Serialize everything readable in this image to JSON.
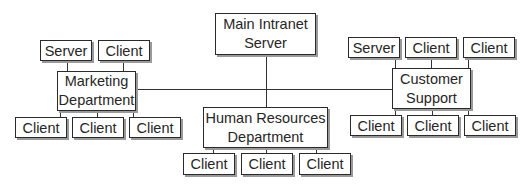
{
  "diagram": {
    "type": "network-topology",
    "main_server": {
      "label_line1": "Main Intranet",
      "label_line2": "Server"
    },
    "departments": [
      {
        "name_line1": "Marketing",
        "name_line2": "Department",
        "top_nodes": [
          "Server",
          "Client"
        ],
        "bottom_nodes": [
          "Client",
          "Client",
          "Client"
        ]
      },
      {
        "name_line1": "Human Resources",
        "name_line2": "Department",
        "top_nodes": [],
        "bottom_nodes": [
          "Client",
          "Client",
          "Client"
        ]
      },
      {
        "name_line1": "Customer",
        "name_line2": "Support",
        "top_nodes": [
          "Server",
          "Client",
          "Client"
        ],
        "bottom_nodes": [
          "Client",
          "Client",
          "Client"
        ]
      }
    ],
    "colors": {
      "line": "#333333",
      "border": "#2a2a2a",
      "shadow": "#9a9a9a",
      "background": "#ffffff"
    }
  }
}
